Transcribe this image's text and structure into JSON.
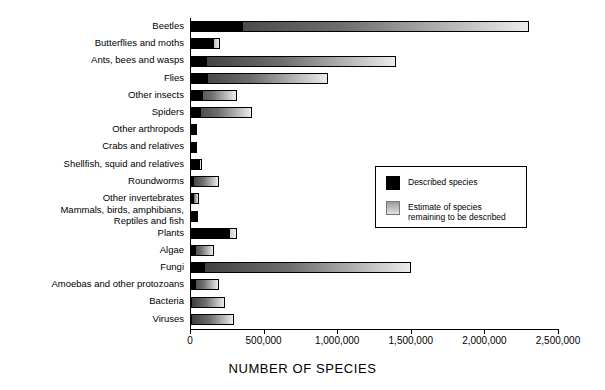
{
  "chart_data": {
    "type": "bar",
    "orientation": "horizontal",
    "stacked": true,
    "title": "",
    "xlabel": "NUMBER OF SPECIES",
    "ylabel": "",
    "xlim": [
      0,
      2500000
    ],
    "grid": false,
    "tick_labels": [
      "0",
      "500,000",
      "1,000,000",
      "1,500,000",
      "2,000,000",
      "2,500,000"
    ],
    "tick_values": [
      0,
      500000,
      1000000,
      1500000,
      2000000,
      2500000
    ],
    "categories": [
      "Beetles",
      "Butterflies and moths",
      "Ants, bees and wasps",
      "Flies",
      "Other insects",
      "Spiders",
      "Other arthropods",
      "Crabs and relatives",
      "Shellfish, squid and relatives",
      "Roundworms",
      "Other invertebrates",
      "Mammals, birds, amphibians,\nReptiles and fish",
      "Plants",
      "Algae",
      "Fungi",
      "Amoebas and other protozoans",
      "Bacteria",
      "Viruses"
    ],
    "series": [
      {
        "name": "Described species",
        "color": "#000000",
        "values": [
          360000,
          165000,
          115000,
          120000,
          90000,
          75000,
          40000,
          47000,
          70000,
          25000,
          30000,
          55000,
          270000,
          40000,
          100000,
          40000,
          10000,
          5000
        ]
      },
      {
        "name": "Estimate of species remaining to be described",
        "color": "#9a9a9a",
        "values": [
          1940000,
          40000,
          1285000,
          820000,
          230000,
          345000,
          10000,
          3000,
          10000,
          175000,
          30000,
          0,
          50000,
          120000,
          1400000,
          160000,
          230000,
          295000
        ]
      }
    ],
    "totals": [
      2300000,
      205000,
      1400000,
      940000,
      320000,
      420000,
      50000,
      50000,
      80000,
      200000,
      60000,
      55000,
      320000,
      160000,
      1500000,
      200000,
      240000,
      300000
    ],
    "legend": {
      "position": "center-right",
      "entries": [
        {
          "label": "Described species",
          "swatch": "solid-black"
        },
        {
          "label": "Estimate of species\nremaining to be described",
          "swatch": "gradient-gray"
        }
      ]
    }
  }
}
